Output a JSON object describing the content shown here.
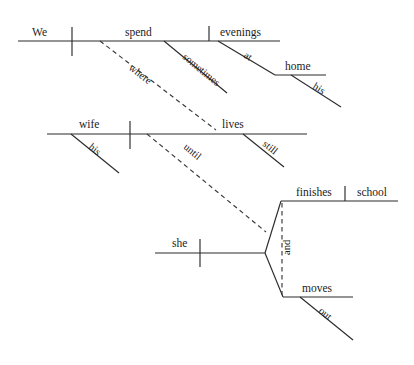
{
  "diagram": {
    "kind": "reed-kellogg-sentence-diagram",
    "ink_color": "#2b2b2b",
    "dashed_color": "#3a3a3a",
    "background_color": "#ffffff",
    "sentence": "We spend evenings sometimes at his home where his wife still lives until she finishes school and moves out",
    "clauses": [
      {
        "id": "main-clause",
        "subject": "We",
        "verb": "spend",
        "object": "evenings",
        "modifiers": [
          "sometimes",
          "at",
          "home",
          "his"
        ]
      },
      {
        "id": "where-clause",
        "connector": "where",
        "subject": "wife",
        "verb": "lives",
        "modifiers": [
          "his",
          "still"
        ]
      },
      {
        "id": "until-clause",
        "connector": "until",
        "subject": "she",
        "verbs": [
          "finishes",
          "moves"
        ],
        "object": "school",
        "conjunction": "and",
        "modifiers": [
          "out"
        ]
      }
    ],
    "words": {
      "we": "We",
      "spend": "spend",
      "evenings": "evenings",
      "where": "where",
      "sometimes": "sometimes",
      "at": "at",
      "home": "home",
      "his_home": "his",
      "wife": "wife",
      "his_wife": "his",
      "lives": "lives",
      "still": "still",
      "until": "until",
      "she": "she",
      "finishes": "finishes",
      "school": "school",
      "and": "and",
      "moves": "moves",
      "out": "out"
    }
  }
}
